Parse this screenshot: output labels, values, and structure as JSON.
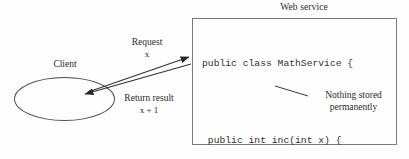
{
  "diagram": {
    "title_label": "Web service",
    "client_label": "Client",
    "request": {
      "label": "Request",
      "payload": "x"
    },
    "response": {
      "label": "Return result",
      "payload": "x + 1"
    },
    "annotation": {
      "line1": "Nothing stored",
      "line2": "permanently"
    },
    "code": {
      "lines": [
        "public class MathService {",
        "",
        " public int inc(int x) {",
        "  return x + 1;",
        " }",
        " ...",
        "}"
      ]
    },
    "colors": {
      "stroke": "#4a4a4a",
      "box_border": "#7a7a7a",
      "text": "#2b2b2b",
      "code_text": "#303030",
      "background": "#fdfdfd"
    }
  }
}
